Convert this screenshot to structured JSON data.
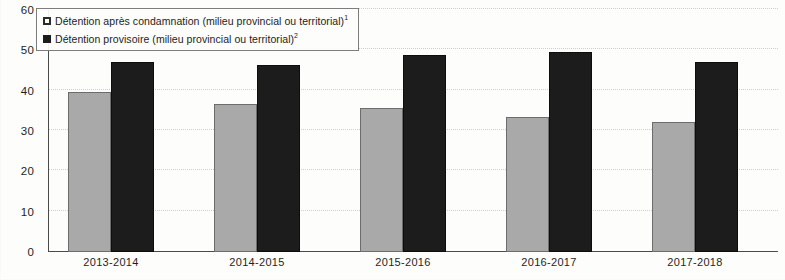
{
  "chart_data": {
    "type": "bar",
    "title": "",
    "xlabel": "",
    "ylabel": "",
    "ylim": [
      0,
      60
    ],
    "yticks": [
      0,
      10,
      20,
      30,
      40,
      50,
      60
    ],
    "grid": true,
    "legend_position": "top-left",
    "categories": [
      "2013-2014",
      "2014-2015",
      "2015-2016",
      "2016-2017",
      "2017-2018"
    ],
    "series": [
      {
        "name": "Détention après condamnation (milieu provincial ou territorial)",
        "footnote": "1",
        "color": "#a9a9a9",
        "values": [
          39.6,
          36.8,
          35.6,
          33.5,
          32.3
        ]
      },
      {
        "name": "Détention provisoire (milieu provincial ou territorial)",
        "footnote": "2",
        "color": "#1c1c1c",
        "values": [
          47.1,
          46.3,
          48.9,
          49.6,
          47.0
        ]
      }
    ]
  },
  "legend": {
    "items": [
      {
        "label": "Détention après condamnation (milieu provincial ou territorial)",
        "footnote": "1",
        "marker": "hollow-square-marker"
      },
      {
        "label": "Détention provisoire (milieu provincial ou territorial)",
        "footnote": "2",
        "marker": "filled-square-marker"
      }
    ]
  },
  "axis": {
    "y_tick_labels": [
      "60",
      "50",
      "40",
      "30",
      "20",
      "10",
      "0"
    ],
    "x_tick_labels": [
      "2013-2014",
      "2014-2015",
      "2015-2016",
      "2016-2017",
      "2017-2018"
    ]
  }
}
